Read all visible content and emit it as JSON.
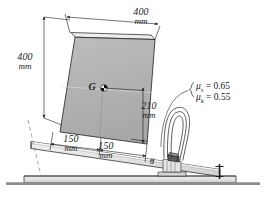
{
  "figure": {
    "background_color": "#ffffff",
    "line_color": "#1a1a1a",
    "block_fill": "#b4b4b4",
    "ramp_fill": "#e8e8e6",
    "ground_fill": "#dcdcda"
  },
  "dimensions": {
    "top_width_value": "400",
    "top_width_unit": "mm",
    "left_height_value": "400",
    "left_height_unit": "mm",
    "cg_height_value": "210",
    "cg_height_unit": "mm",
    "base_left_value": "150",
    "base_left_unit": "mm",
    "base_right_value": "150",
    "base_right_unit": "mm"
  },
  "labels": {
    "center_of_gravity": "G",
    "angle": "θ"
  },
  "friction": {
    "static_symbol": "μ",
    "static_sub": "s",
    "static_eq": "= 0.65",
    "kinetic_symbol": "μ",
    "kinetic_sub": "k",
    "kinetic_eq": "= 0.55",
    "static_full": "μₛ = 0.65",
    "kinetic_full": "μₖ = 0.55"
  }
}
